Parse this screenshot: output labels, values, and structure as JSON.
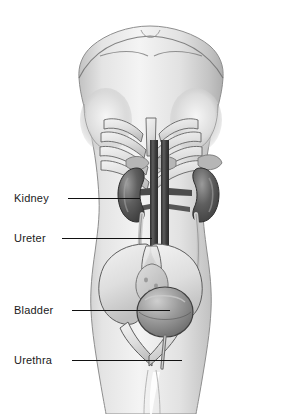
{
  "illustration": {
    "title": "Female urinary system anatomy",
    "subject": "female torso, anterior view",
    "style": "grayscale medical illustration",
    "background_color": "#ffffff"
  },
  "colors": {
    "background": "#ffffff",
    "skin_light": "#f2f2f2",
    "skin_mid": "#d8d8d8",
    "skin_shadow": "#b6b6b6",
    "outline": "#4f4f4f",
    "bone_light": "#eeeeee",
    "bone_mid": "#cfcfcf",
    "bone_outline": "#5a5a5a",
    "kidney_dark": "#4a4a4a",
    "kidney_mid": "#6e6e6e",
    "kidney_highlight": "#9a9a9a",
    "vessel_dark": "#3a3a3a",
    "vessel_mid": "#555555",
    "ureter": "#e6e6e6",
    "ureter_outline": "#6a6a6a",
    "bladder_fill": "#8d8d8d",
    "bladder_highlight": "#bdbdbd",
    "bladder_outline": "#3f3f3f",
    "uterus": "#cdcdcd",
    "label_text": "#1a1a1a",
    "leader_line": "#111111"
  },
  "labels": [
    {
      "id": "kidney",
      "text": "Kidney",
      "text_x": 14,
      "text_y": 192,
      "line_x": 68,
      "line_y": 198,
      "line_width": 72
    },
    {
      "id": "ureter",
      "text": "Ureter",
      "text_x": 14,
      "text_y": 232,
      "line_x": 62,
      "line_y": 238,
      "line_width": 90
    },
    {
      "id": "bladder",
      "text": "Bladder",
      "text_x": 14,
      "text_y": 304,
      "line_x": 72,
      "line_y": 310,
      "line_width": 98
    },
    {
      "id": "urethra",
      "text": "Urethra",
      "text_x": 14,
      "text_y": 354,
      "line_x": 72,
      "line_y": 360,
      "line_width": 110
    }
  ],
  "anatomy": {
    "parts": [
      {
        "name": "torso-silhouette",
        "description": "female torso from shoulders to upper thighs"
      },
      {
        "name": "clavicles",
        "description": "collar bones below neck notch"
      },
      {
        "name": "breasts",
        "description": "soft tissue shading at chest sides"
      },
      {
        "name": "rib-cage",
        "description": "ribs and costal margin forming inverted V"
      },
      {
        "name": "left-kidney",
        "description": "dark bean-shaped organ, viewer left"
      },
      {
        "name": "right-kidney",
        "description": "dark bean-shaped organ, viewer right"
      },
      {
        "name": "adrenal-glands",
        "description": "small mottled caps above kidneys"
      },
      {
        "name": "aorta",
        "description": "dark vertical vessel, midline"
      },
      {
        "name": "inferior-vena-cava",
        "description": "dark vertical vessel beside aorta"
      },
      {
        "name": "renal-vessels",
        "description": "horizontal branches to kidneys"
      },
      {
        "name": "left-ureter",
        "description": "pale tube descending to bladder"
      },
      {
        "name": "right-ureter",
        "description": "pale tube descending to bladder"
      },
      {
        "name": "pelvis",
        "description": "iliac wings flaring outward"
      },
      {
        "name": "uterus",
        "description": "pear-shaped organ above bladder"
      },
      {
        "name": "bladder",
        "description": "rounded sac in pelvic bowl"
      },
      {
        "name": "urethra",
        "description": "short tube descending from bladder"
      }
    ]
  }
}
